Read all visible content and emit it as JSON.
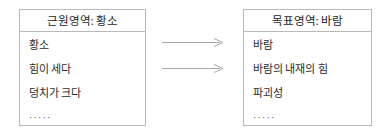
{
  "diagram": {
    "source_box": {
      "header": "근원영역: 황소",
      "items": [
        "황소",
        "힘이 세다",
        "덩치가 크다",
        "·····"
      ]
    },
    "target_box": {
      "header": "목표영역: 바람",
      "items": [
        "바람",
        "바람의 내재의 힘",
        "파괴성",
        "·····"
      ]
    },
    "arrows": [
      {
        "label": ""
      },
      {
        "label": ""
      }
    ],
    "colors": {
      "border": "#b9b9b9",
      "text": "#2b2b2b",
      "arrow": "#a8a8a8",
      "background": "#ffffff"
    }
  }
}
